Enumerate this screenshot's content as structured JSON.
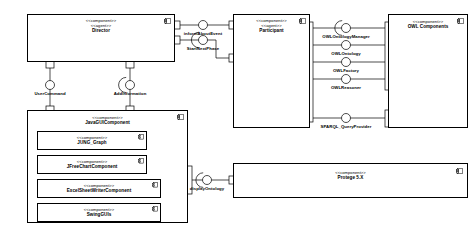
{
  "diagram": {
    "stereotype_component": "<<component>>",
    "stereotype_agent": "<<agent>>",
    "colors": {
      "line": "#000000",
      "fill": "#ffffff",
      "text": "#000000"
    }
  },
  "components": [
    {
      "id": "director",
      "stereotypes": [
        "<<component>>",
        "<<agent>>"
      ],
      "name": "Director"
    },
    {
      "id": "participant",
      "stereotypes": [
        "<<component>>",
        "<<agent>>"
      ],
      "name": "Participant"
    },
    {
      "id": "owl-components",
      "stereotypes": [
        "<<component>>"
      ],
      "name": "OWL Components"
    },
    {
      "id": "java-gui-component",
      "stereotypes": [
        "<<component>>"
      ],
      "name": "JavaGUIComponent"
    },
    {
      "id": "jung-graph",
      "stereotypes": [
        "<<component>>"
      ],
      "name": "JUNG_Graph"
    },
    {
      "id": "jfreechart-component",
      "stereotypes": [
        "<<component>>"
      ],
      "name": "JFreeChartComponent"
    },
    {
      "id": "excelsheetwriter",
      "stereotypes": [
        "<<component>>"
      ],
      "name": "ExcelSheetWriterComponent"
    },
    {
      "id": "swing-guis",
      "stereotypes": [
        "<<component>>"
      ],
      "name": "SwingGUIs"
    },
    {
      "id": "protege",
      "stereotypes": [
        "<<component>>"
      ],
      "name": "Protege 5.X"
    }
  ],
  "interfaces": [
    {
      "id": "inform-about-event",
      "name": "informAboutEvent",
      "provider": "participant",
      "consumer": "director"
    },
    {
      "id": "start-next-phase",
      "name": "StartNextPhase",
      "provider": "participant",
      "consumer": "director"
    },
    {
      "id": "user-command",
      "name": "UserCommand",
      "provider": "java-gui-component",
      "consumer": "director"
    },
    {
      "id": "add-information",
      "name": "AddInformation",
      "provider": "java-gui-component",
      "consumer": "director"
    },
    {
      "id": "owl-ontology-manager",
      "name": "OWLOntologyManager",
      "provider": "owl-components",
      "consumer": "participant"
    },
    {
      "id": "owl-ontology",
      "name": "OWLOntology",
      "provider": "owl-components",
      "consumer": "participant"
    },
    {
      "id": "owl-factory",
      "name": "OWLFactory",
      "provider": "owl-components",
      "consumer": "participant"
    },
    {
      "id": "owl-reasoner",
      "name": "OWLReasoner",
      "provider": "owl-components",
      "consumer": "participant"
    },
    {
      "id": "sparql-query-provider",
      "name": "SPARQL_QueryProvider",
      "provider": "owl-components",
      "consumer": "participant"
    },
    {
      "id": "display-ontology",
      "name": "displayOntology",
      "provider": "protege",
      "consumer": "java-gui-component"
    }
  ]
}
